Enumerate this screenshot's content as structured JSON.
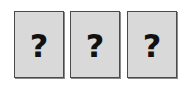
{
  "cards": [
    {
      "label": "?",
      "x": 14
    },
    {
      "label": "?",
      "x": 70
    },
    {
      "label": "?",
      "x": 127
    }
  ],
  "colors": {
    "card_fill": "#d9d9d9",
    "card_border": "#4a4a4a",
    "glyph": "#111111"
  }
}
